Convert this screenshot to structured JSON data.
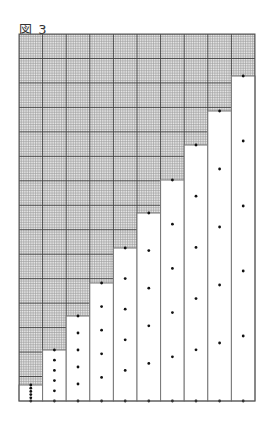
{
  "figure": {
    "title": "図 3"
  },
  "layout": {
    "frame": {
      "x": 19,
      "y": 34,
      "width": 236,
      "height": 367
    },
    "columns": 10,
    "major_rows": 15,
    "minor_per_major": 10,
    "grid_minor_color": "#9a9a9a",
    "grid_major_color": "#3a3a3a",
    "frame_color": "#555555",
    "dot_color": "#111111"
  },
  "chart_data": {
    "type": "bar",
    "title": "図 3",
    "categories": [
      "1",
      "2",
      "3",
      "4",
      "5",
      "6",
      "7",
      "8",
      "9",
      "10"
    ],
    "values_px": [
      16,
      51,
      85,
      118,
      153,
      188,
      221,
      256,
      290,
      325
    ],
    "values_minor_grid_units": [
      6.5,
      21,
      35,
      48,
      63,
      77,
      90,
      105,
      119,
      133
    ],
    "dots_per_column": 6,
    "segments_per_column": 5,
    "grid": true,
    "xlabel": "",
    "ylabel": ""
  }
}
